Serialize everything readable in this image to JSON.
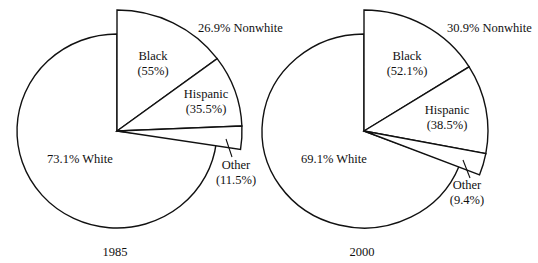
{
  "chart_data": [
    {
      "type": "pie",
      "title": "1985",
      "slices": [
        {
          "label": "White",
          "value": 73.1,
          "display": "73.1% White"
        },
        {
          "label": "Nonwhite",
          "value": 26.9,
          "display": "26.9% Nonwhite",
          "exploded": true,
          "breakdown": [
            {
              "label": "Black",
              "share_of_nonwhite": 55.0,
              "display_pct": "(55%)"
            },
            {
              "label": "Hispanic",
              "share_of_nonwhite": 35.5,
              "display_pct": "(35.5%)"
            },
            {
              "label": "Other",
              "share_of_nonwhite": 11.5,
              "display_pct": "(11.5%)"
            }
          ]
        }
      ]
    },
    {
      "type": "pie",
      "title": "2000",
      "slices": [
        {
          "label": "White",
          "value": 69.1,
          "display": "69.1% White"
        },
        {
          "label": "Nonwhite",
          "value": 30.9,
          "display": "30.9% Nonwhite",
          "exploded": true,
          "breakdown": [
            {
              "label": "Black",
              "share_of_nonwhite": 52.1,
              "display_pct": "(52.1%)"
            },
            {
              "label": "Hispanic",
              "share_of_nonwhite": 38.5,
              "display_pct": "(38.5%)"
            },
            {
              "label": "Other",
              "share_of_nonwhite": 9.4,
              "display_pct": "(9.4%)"
            }
          ]
        }
      ]
    }
  ],
  "pies": [
    {
      "year": "1985",
      "white_label": "73.1% White",
      "nonwhite_label": "26.9% Nonwhite",
      "black_label": "Black",
      "black_pct": "(55%)",
      "hispanic_label": "Hispanic",
      "hispanic_pct": "(35.5%)",
      "other_label": "Other",
      "other_pct": "(11.5%)"
    },
    {
      "year": "2000",
      "white_label": "69.1% White",
      "nonwhite_label": "30.9% Nonwhite",
      "black_label": "Black",
      "black_pct": "(52.1%)",
      "hispanic_label": "Hispanic",
      "hispanic_pct": "(38.5%)",
      "other_label": "Other",
      "other_pct": "(9.4%)"
    }
  ],
  "colors": {
    "line": "#111111",
    "fill": "#ffffff",
    "text": "#111111"
  }
}
